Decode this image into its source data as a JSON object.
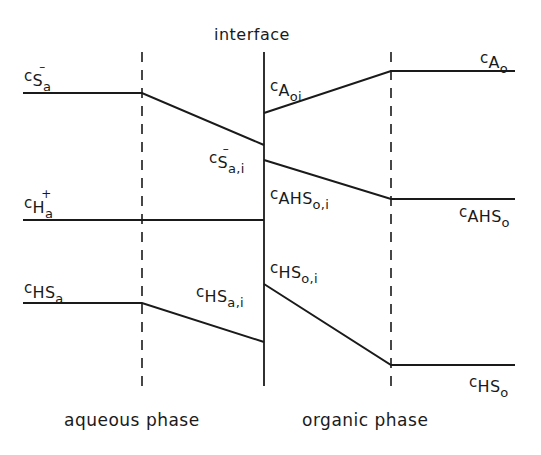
{
  "diagram": {
    "type": "concentration-profile",
    "title_interface": "interface",
    "phases": {
      "left": "aqueous phase",
      "right": "organic phase"
    },
    "labels": {
      "c_Sa": {
        "c": "c",
        "species": "S",
        "phase": "a",
        "charge": "–"
      },
      "c_Sa_i": {
        "c": "c",
        "species": "S",
        "phase": "a,i",
        "charge": "–"
      },
      "c_Ha": {
        "c": "c",
        "species": "H",
        "phase": "a",
        "charge": "+"
      },
      "c_HSa": {
        "c": "c",
        "species": "HS",
        "phase": "a"
      },
      "c_HSa_i": {
        "c": "c",
        "species": "HS",
        "phase": "a,i"
      },
      "c_Aoi": {
        "c": "c",
        "species": "A",
        "phase": "oi"
      },
      "c_Ao": {
        "c": "c",
        "species": "A",
        "phase": "o"
      },
      "c_AHSo_i": {
        "c": "c",
        "species": "AHS",
        "phase": "o,i"
      },
      "c_AHSo": {
        "c": "c",
        "species": "AHS",
        "phase": "o"
      },
      "c_HSo_i": {
        "c": "c",
        "species": "HS",
        "phase": "o,i"
      },
      "c_HSo": {
        "c": "c",
        "species": "HS",
        "phase": "o"
      }
    },
    "colors": {
      "line": "#1a1a1a",
      "background": "#ffffff"
    },
    "geometry": {
      "film_boundary_left_x": 142,
      "interface_x": 264,
      "film_boundary_right_x": 391,
      "profiles": [
        {
          "name": "c_Sa",
          "points": [
            [
              23,
              93
            ],
            [
              142,
              93
            ],
            [
              264,
              145
            ]
          ]
        },
        {
          "name": "c_Ha",
          "points": [
            [
              23,
              220
            ],
            [
              264,
              220
            ]
          ]
        },
        {
          "name": "c_HSa",
          "points": [
            [
              23,
              303
            ],
            [
              142,
              303
            ],
            [
              264,
              342
            ]
          ]
        },
        {
          "name": "c_Ao",
          "points": [
            [
              264,
              113
            ],
            [
              391,
              71
            ],
            [
              515,
              71
            ]
          ]
        },
        {
          "name": "c_AHSo",
          "points": [
            [
              264,
              160
            ],
            [
              391,
              199
            ],
            [
              515,
              199
            ]
          ]
        },
        {
          "name": "c_HSo",
          "points": [
            [
              264,
              284
            ],
            [
              391,
              365
            ],
            [
              515,
              365
            ]
          ]
        }
      ]
    }
  }
}
